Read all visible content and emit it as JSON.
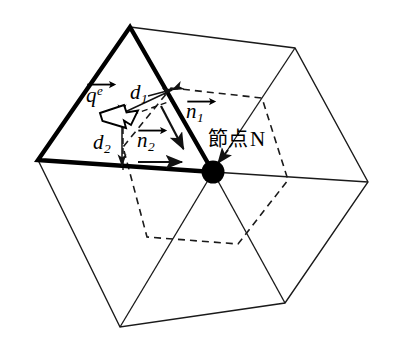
{
  "figure": {
    "background_color": "#ffffff",
    "line_color": "#1a1a1a",
    "width": 394,
    "height": 350
  },
  "labels": {
    "flux_vector": {
      "base": "q",
      "superscript": "e",
      "accent": "vector-arrow",
      "text": "q⃗ᵉ"
    },
    "distance_1": {
      "base": "d",
      "subscript": "1",
      "text": "d₁"
    },
    "distance_2": {
      "base": "d",
      "subscript": "2",
      "text": "d₂"
    },
    "normal_1": {
      "base": "n",
      "subscript": "1",
      "accent": "vector-arrow",
      "text": "n⃗₁"
    },
    "normal_2": {
      "base": "n",
      "subscript": "2",
      "accent": "vector-arrow",
      "text": "n⃗₂"
    },
    "node": {
      "japanese": "節点",
      "latin": "N",
      "text": "節点 N"
    }
  },
  "geometry": {
    "node_N": {
      "x": 213,
      "y": 172,
      "radius": 11,
      "fill": "#000000"
    },
    "outer_hexagon": {
      "stroke_width": 1.3,
      "style": "solid",
      "vertices": [
        {
          "x": 130,
          "y": 27
        },
        {
          "x": 295,
          "y": 48
        },
        {
          "x": 368,
          "y": 182
        },
        {
          "x": 285,
          "y": 303
        },
        {
          "x": 120,
          "y": 327
        },
        {
          "x": 38,
          "y": 160
        }
      ]
    },
    "element_triangle": {
      "stroke_width": 4.2,
      "style": "solid-bold",
      "vertices": [
        {
          "x": 130,
          "y": 27
        },
        {
          "x": 213,
          "y": 172
        },
        {
          "x": 38,
          "y": 160
        }
      ]
    },
    "control_volume_hexagon": {
      "stroke_width": 1.5,
      "style": "dashed",
      "dash_pattern": "7,5",
      "vertices": [
        {
          "x": 171,
          "y": 88
        },
        {
          "x": 262,
          "y": 98
        },
        {
          "x": 288,
          "y": 180
        },
        {
          "x": 238,
          "y": 244
        },
        {
          "x": 147,
          "y": 237
        },
        {
          "x": 123,
          "y": 147
        }
      ]
    },
    "spokes_from_node": [
      {
        "x": 130,
        "y": 27
      },
      {
        "x": 295,
        "y": 48
      },
      {
        "x": 368,
        "y": 182
      },
      {
        "x": 285,
        "y": 303
      },
      {
        "x": 120,
        "y": 327
      },
      {
        "x": 38,
        "y": 160
      }
    ],
    "normal_vector_1": {
      "x1": 162,
      "y1": 107,
      "x2": 184,
      "y2": 150,
      "stroke_width": 2.1
    },
    "normal_vector_2": {
      "x1": 139,
      "y1": 162,
      "x2": 184,
      "y2": 162,
      "stroke_width": 2.1
    },
    "distance_1_arrow": {
      "x1": 172,
      "y1": 90,
      "x2": 128,
      "y2": 111,
      "stroke_width": 1.4,
      "double_headed": true
    },
    "distance_2_arrow": {
      "x1": 122,
      "y1": 119,
      "x2": 122,
      "y2": 163,
      "stroke_width": 1.4,
      "double_headed": true
    },
    "flux_arrow": {
      "type": "outlined-block-arrow",
      "tail": {
        "x": 104,
        "y": 115
      },
      "head": {
        "x": 140,
        "y": 128
      },
      "fill": "#ffffff",
      "stroke": "#000000"
    }
  }
}
